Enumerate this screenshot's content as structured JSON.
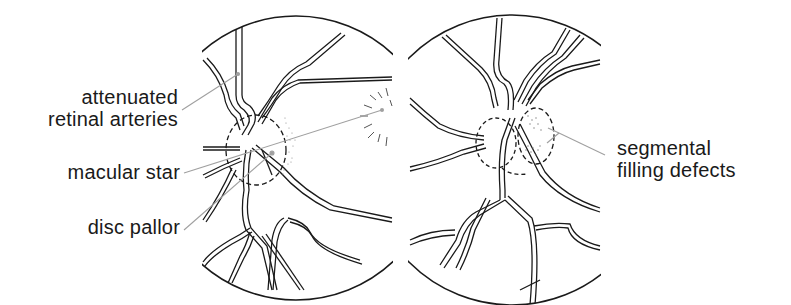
{
  "figure": {
    "left_panel": {
      "labels": [
        {
          "id": "attenuated",
          "lines": [
            "attenuated",
            "retinal arteries"
          ]
        },
        {
          "id": "macular",
          "lines": [
            "macular star"
          ]
        },
        {
          "id": "disc",
          "lines": [
            "disc pallor"
          ]
        }
      ]
    },
    "right_panel": {
      "labels": [
        {
          "id": "segmental",
          "lines": [
            "segmental",
            "filling defects"
          ]
        }
      ]
    },
    "colors": {
      "ink": "#1a1a1a",
      "leader": "#a0a0a0",
      "background": "#ffffff"
    }
  }
}
